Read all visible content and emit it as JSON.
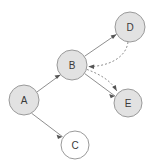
{
  "diagram": {
    "type": "directed-graph",
    "title": "",
    "width": 154,
    "height": 167,
    "background_color": "#ffffff",
    "colors": {
      "node_fill_filled": "#e2e2e2",
      "node_fill_open": "#ffffff",
      "node_stroke": "#9a9a9a",
      "edge_stroke": "#8f8f8f",
      "arrow_fill": "#555555",
      "label_color": "#3a3a3a"
    },
    "nodes": [
      {
        "id": "A",
        "label": "A",
        "cx": 24,
        "cy": 100,
        "r": 15,
        "style": "filled"
      },
      {
        "id": "B",
        "label": "B",
        "cx": 72,
        "cy": 65,
        "r": 15,
        "style": "filled"
      },
      {
        "id": "C",
        "label": "C",
        "cx": 75,
        "cy": 145,
        "r": 14,
        "style": "open"
      },
      {
        "id": "D",
        "label": "D",
        "cx": 130,
        "cy": 27,
        "r": 15,
        "style": "filled"
      },
      {
        "id": "E",
        "label": "E",
        "cx": 128,
        "cy": 103,
        "r": 14,
        "style": "filled"
      }
    ],
    "edges": [
      {
        "id": "A-B",
        "from": "A",
        "to": "B",
        "line": "solid",
        "shape": "straight",
        "arrow": "end"
      },
      {
        "id": "A-C",
        "from": "A",
        "to": "C",
        "line": "solid",
        "shape": "straight",
        "arrow": "end"
      },
      {
        "id": "B-D",
        "from": "B",
        "to": "D",
        "line": "solid",
        "shape": "straight",
        "arrow": "end"
      },
      {
        "id": "B-E",
        "from": "B",
        "to": "E",
        "line": "solid",
        "shape": "straight",
        "arrow": "end"
      },
      {
        "id": "D-B",
        "from": "D",
        "to": "B",
        "line": "dashed",
        "shape": "curved",
        "arrow": "end"
      },
      {
        "id": "B-E-curved",
        "from": "B",
        "to": "E",
        "line": "dashed",
        "shape": "curved",
        "arrow": "end"
      }
    ]
  }
}
